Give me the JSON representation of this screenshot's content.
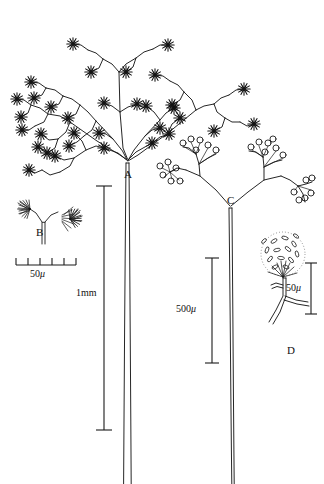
{
  "figure": {
    "background_color": "#ffffff",
    "ink_color": "#1a1a1a",
    "width": 324,
    "height": 484
  },
  "panel_labels": [
    {
      "id": "A",
      "text": "A",
      "x": 124,
      "y": 169,
      "description": "whole dendritic sporangiophore head with star-like sporangial clusters atop a long stalk"
    },
    {
      "id": "B",
      "text": "B",
      "x": 36,
      "y": 227,
      "description": "detail of a forked branch bearing two brush-like penicillate clusters"
    },
    {
      "id": "C",
      "text": "C",
      "x": 227,
      "y": 195,
      "description": "detail of branch system bearing globose sporangia on short sterigmata"
    },
    {
      "id": "D",
      "text": "D",
      "x": 287,
      "y": 345,
      "description": "detail of a single stippled sporangium containing rod-shaped spores on a forked stalk"
    }
  ],
  "scale_bars": [
    {
      "name": "scale-bar-b",
      "label": "50",
      "unit": "μ",
      "orientation": "horizontal",
      "ticked": true,
      "tick_count": 6,
      "x1": 16,
      "x2": 76,
      "y": 265,
      "label_x": 30,
      "label_y": 269
    },
    {
      "name": "scale-bar-a",
      "label": "1mm",
      "unit": "",
      "orientation": "vertical",
      "ticked": false,
      "x": 104,
      "y1": 186,
      "y2": 430,
      "label_x": 76,
      "label_y": 288
    },
    {
      "name": "scale-bar-c",
      "label": "500",
      "unit": "μ",
      "orientation": "vertical",
      "ticked": false,
      "x": 212,
      "y1": 258,
      "y2": 363,
      "label_x": 176,
      "label_y": 304
    },
    {
      "name": "scale-bar-d",
      "label": "50",
      "unit": "μ",
      "orientation": "vertical",
      "ticked": false,
      "x": 311,
      "y1": 263,
      "y2": 314,
      "label_x": 286,
      "label_y": 283
    }
  ],
  "icon_names": {
    "star_cluster": "star-sporangium-icon",
    "brush_cluster": "brush-conidia-icon",
    "globose_sporangium": "globose-sporangium-icon",
    "stippled_sporangium": "stippled-spore-head-icon",
    "stalk": "stalk-line-icon"
  }
}
